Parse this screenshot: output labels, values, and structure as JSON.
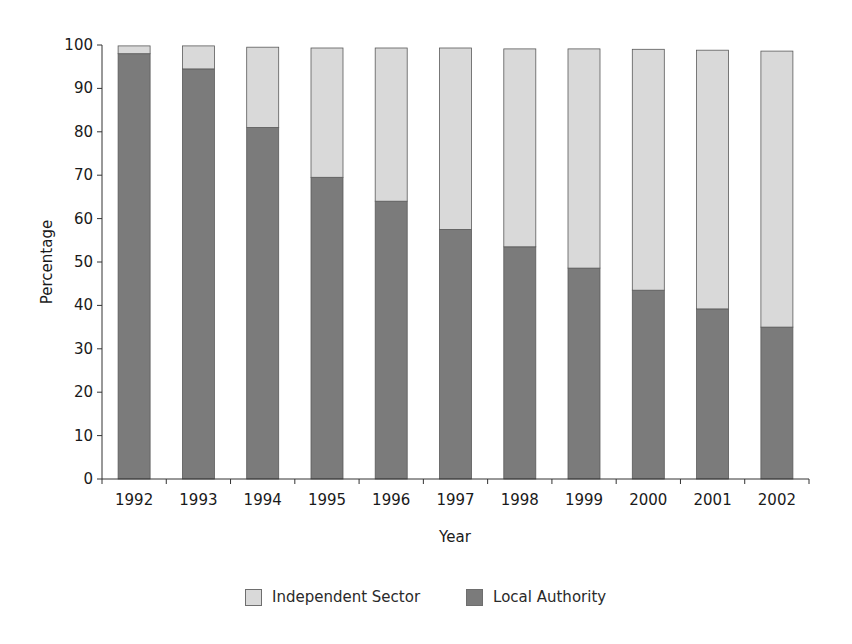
{
  "chart_data": {
    "type": "bar",
    "stacked": true,
    "title": "",
    "xlabel": "Year",
    "ylabel": "Percentage",
    "ylim": [
      0,
      100
    ],
    "yticks": [
      0,
      10,
      20,
      30,
      40,
      50,
      60,
      70,
      80,
      90,
      100
    ],
    "grid": false,
    "legend_position": "bottom",
    "categories": [
      "1992",
      "1993",
      "1994",
      "1995",
      "1996",
      "1997",
      "1998",
      "1999",
      "2000",
      "2001",
      "2002"
    ],
    "series": [
      {
        "name": "Local Authority",
        "color": "#7b7b7b",
        "values": [
          98,
          94.5,
          81,
          69.5,
          64,
          57.5,
          53.5,
          48.6,
          43.5,
          39.2,
          35
        ]
      },
      {
        "name": "Independent Sector",
        "color": "#d9d9d9",
        "values": [
          1.8,
          5.3,
          18.5,
          29.8,
          35.3,
          41.8,
          45.6,
          50.5,
          55.5,
          59.6,
          63.6
        ]
      }
    ]
  },
  "legend": {
    "items": [
      {
        "label": "Independent Sector",
        "color": "#d9d9d9"
      },
      {
        "label": "Local Authority",
        "color": "#7b7b7b"
      }
    ]
  }
}
